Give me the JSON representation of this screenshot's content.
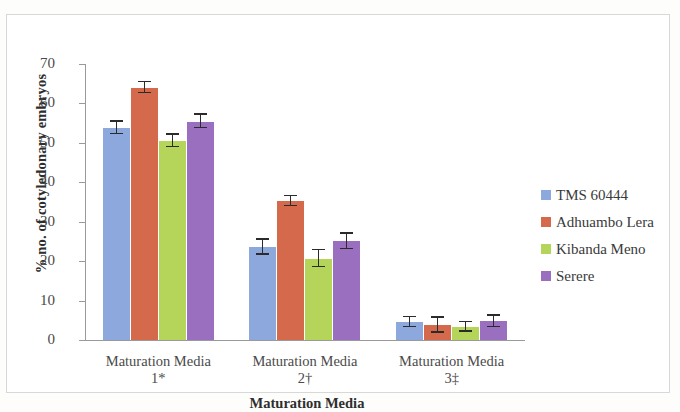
{
  "chart_data": {
    "type": "bar",
    "title": "",
    "xlabel": "Maturation Media",
    "ylabel": "% no. of cotyledonary embryos",
    "categories": [
      "Maturation Media 1*",
      "Maturation Media 2†",
      "Maturation Media 3‡"
    ],
    "category_lines": [
      [
        "Maturation Media",
        "1*"
      ],
      [
        "Maturation Media",
        "2†"
      ],
      [
        "Maturation Media",
        "3‡"
      ]
    ],
    "ylim": [
      0,
      70
    ],
    "yticks": [
      0,
      10,
      20,
      30,
      40,
      50,
      60,
      70
    ],
    "grid": false,
    "legend_position": "right",
    "series": [
      {
        "name": "TMS 60444",
        "color": "#8CA8DC",
        "values": [
          53.8,
          23.5,
          4.5
        ],
        "errors": [
          1.6,
          1.9,
          1.3
        ]
      },
      {
        "name": "Adhuambo Lera",
        "color": "#D4694C",
        "values": [
          64.0,
          35.2,
          3.8
        ],
        "errors": [
          1.4,
          1.3,
          1.9
        ]
      },
      {
        "name": "Kibanda Meno",
        "color": "#B4D45A",
        "values": [
          50.5,
          20.6,
          3.3
        ],
        "errors": [
          1.6,
          2.2,
          1.2
        ]
      },
      {
        "name": "Serere",
        "color": "#9A6FBF",
        "values": [
          55.4,
          25.0,
          4.7
        ],
        "errors": [
          1.7,
          2.0,
          1.4
        ]
      }
    ]
  },
  "axis": {
    "y_title": "% no. of cotyledonary embryos",
    "x_title": "Maturation Media"
  }
}
